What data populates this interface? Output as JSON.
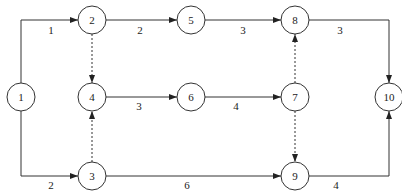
{
  "diagram": {
    "type": "activity-on-arrow network",
    "nodes": [
      {
        "id": "1",
        "label": "1",
        "x": 21,
        "y": 97
      },
      {
        "id": "2",
        "label": "2",
        "x": 92,
        "y": 20
      },
      {
        "id": "5",
        "label": "5",
        "x": 191,
        "y": 20
      },
      {
        "id": "8",
        "label": "8",
        "x": 295,
        "y": 20
      },
      {
        "id": "10",
        "label": "10",
        "x": 389,
        "y": 97
      },
      {
        "id": "4",
        "label": "4",
        "x": 92,
        "y": 97
      },
      {
        "id": "6",
        "label": "6",
        "x": 191,
        "y": 97
      },
      {
        "id": "7",
        "label": "7",
        "x": 295,
        "y": 97
      },
      {
        "id": "3",
        "label": "3",
        "x": 92,
        "y": 176
      },
      {
        "id": "9",
        "label": "9",
        "x": 295,
        "y": 176
      }
    ],
    "edges": [
      {
        "from": "1",
        "to": "2",
        "label": "1",
        "dashed": false
      },
      {
        "from": "2",
        "to": "5",
        "label": "2",
        "dashed": false
      },
      {
        "from": "5",
        "to": "8",
        "label": "3",
        "dashed": false
      },
      {
        "from": "8",
        "to": "10",
        "label": "3",
        "dashed": false
      },
      {
        "from": "2",
        "to": "4",
        "label": "",
        "dashed": true
      },
      {
        "from": "4",
        "to": "6",
        "label": "3",
        "dashed": false
      },
      {
        "from": "6",
        "to": "7",
        "label": "4",
        "dashed": false
      },
      {
        "from": "7",
        "to": "8",
        "label": "",
        "dashed": true
      },
      {
        "from": "7",
        "to": "9",
        "label": "",
        "dashed": true
      },
      {
        "from": "1",
        "to": "3",
        "label": "2",
        "dashed": false
      },
      {
        "from": "3",
        "to": "4",
        "label": "",
        "dashed": true
      },
      {
        "from": "3",
        "to": "9",
        "label": "6",
        "dashed": false
      },
      {
        "from": "9",
        "to": "10",
        "label": "4",
        "dashed": false
      }
    ]
  }
}
